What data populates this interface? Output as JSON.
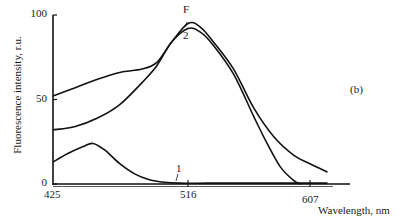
{
  "chart_data": {
    "type": "line",
    "title": "",
    "panel_label": "(b)",
    "xlabel": "Wavelength, nm",
    "ylabel": "Fluorescence intensity, r.u.",
    "xlim": [
      425,
      625
    ],
    "ylim": [
      0,
      100
    ],
    "x_ticks": [
      "425",
      "516",
      "607"
    ],
    "y_ticks": [
      "0",
      "50",
      "100"
    ],
    "grid": false,
    "legend": "inline curve labels",
    "series": [
      {
        "name": "F",
        "x": [
          425,
          440,
          455,
          470,
          485,
          495,
          505,
          516,
          525,
          535,
          550,
          565,
          580,
          595,
          607,
          620
        ],
        "y": [
          52,
          57,
          62,
          66,
          68,
          72,
          84,
          95,
          93,
          84,
          68,
          45,
          28,
          17,
          12,
          7
        ]
      },
      {
        "name": "2",
        "x": [
          425,
          440,
          455,
          470,
          485,
          495,
          505,
          516,
          525,
          535,
          550,
          565,
          575,
          585,
          595,
          600
        ],
        "y": [
          32,
          34,
          39,
          47,
          60,
          70,
          84,
          92,
          90,
          82,
          65,
          40,
          24,
          10,
          2,
          0
        ]
      },
      {
        "name": "1",
        "x": [
          425,
          435,
          445,
          452,
          460,
          470,
          480,
          490,
          500,
          510,
          530,
          560,
          590,
          620
        ],
        "y": [
          13,
          18,
          22,
          24,
          20,
          12,
          6,
          2.5,
          1,
          0.5,
          0.5,
          0.5,
          0.5,
          0.5
        ]
      }
    ]
  },
  "labels": {
    "ylabel": "Fluorescence intensity, r.u.",
    "xlabel": "Wavelength, nm",
    "panel": "(b)",
    "ytick_0": "0",
    "ytick_50": "50",
    "ytick_100": "100",
    "xtick_425": "425",
    "xtick_516": "516",
    "xtick_607": "607",
    "curve_F": "F",
    "curve_2": "2",
    "curve_1": "1"
  }
}
